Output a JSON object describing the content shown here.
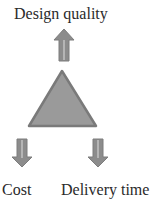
{
  "diagram": {
    "title": "Design quality",
    "nodes": [
      {
        "id": "design-quality",
        "label": "Design quality",
        "direction": "up"
      },
      {
        "id": "cost",
        "label": "Cost",
        "direction": "down"
      },
      {
        "id": "delivery-time",
        "label": "Delivery time",
        "direction": "down"
      }
    ],
    "center_shape": "triangle",
    "colors": {
      "triangle_fill": "#9a9a9a",
      "triangle_stroke": "#7a7a7a",
      "arrow_fill": "#8c8c8c",
      "arrow_highlight": "#b5b5b5",
      "text": "#2a2a2a"
    }
  }
}
